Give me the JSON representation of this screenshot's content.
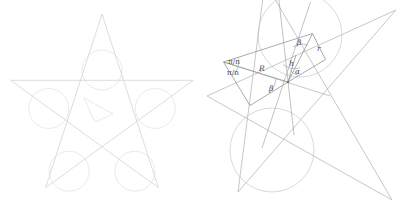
{
  "figure": {
    "canvas": {
      "width": 406,
      "height": 211,
      "background": "#ffffff"
    },
    "colors": {
      "star_left_stroke": "#d8d8d8",
      "circle_left_stroke": "#e2e2e2",
      "star_right_stroke": "#bdbdbd",
      "circle_right_stroke": "#cccccc",
      "annotation_stroke": "#8a8a8a",
      "label_color": "#4a4a4a"
    }
  },
  "left_panel": {
    "name": "pentagram-overview",
    "description": "Five pointed star polygon {5/2} with a circle inscribed in each of the five points",
    "star": {
      "points": 5,
      "center_x": 102,
      "center_y": 110,
      "outer_radius": 96,
      "rotation_deg": -90,
      "vertices": [
        {
          "x": 102.0,
          "y": 14.0
        },
        {
          "x": 193.3,
          "y": 80.3
        },
        {
          "x": 158.4,
          "y": 187.7
        },
        {
          "x": 45.6,
          "y": 187.7
        },
        {
          "x": 10.7,
          "y": 80.3
        }
      ]
    },
    "circles": [
      {
        "cx": 102.0,
        "cy": 70.0,
        "r": 20.0
      },
      {
        "cx": 155.3,
        "cy": 108.5,
        "r": 20.0
      },
      {
        "cx": 134.9,
        "cy": 171.2,
        "r": 20.0
      },
      {
        "cx": 69.1,
        "cy": 171.2,
        "r": 20.0
      },
      {
        "cx": 48.7,
        "cy": 108.5,
        "r": 20.0
      }
    ],
    "inner_marker": {
      "description": "small arrow-like inner detail near middle right of star",
      "path": "M 84 98 L 113 114 L 95 122 Z"
    }
  },
  "right_panel": {
    "name": "pentagram-detail",
    "description": "Rotated and magnified detail of one star point showing the construction angles and radii",
    "star": {
      "points": 5,
      "center_x": 300,
      "center_y": 66,
      "outer_radius": 150,
      "rotation_deg": -35
    },
    "annotations": {
      "apex": {
        "x": 288,
        "y": 82
      },
      "labels": [
        {
          "id": "pi-over-n-upper",
          "text": "π/n",
          "x": 232,
          "y": 61,
          "italic": false
        },
        {
          "id": "pi-over-n-lower",
          "text": "π/n",
          "x": 231,
          "y": 72,
          "italic": false
        },
        {
          "id": "big-r",
          "text": "R",
          "x": 262,
          "y": 68,
          "italic": true
        },
        {
          "id": "beta-lower",
          "text": "β",
          "x": 272,
          "y": 88,
          "italic": true
        },
        {
          "id": "beta-upper",
          "text": "β",
          "x": 300,
          "y": 42,
          "italic": true
        },
        {
          "id": "h-height",
          "text": "h",
          "x": 292,
          "y": 63,
          "italic": true
        },
        {
          "id": "alpha",
          "text": "α",
          "x": 298,
          "y": 71,
          "italic": true
        },
        {
          "id": "small-r",
          "text": "r",
          "x": 319,
          "y": 48,
          "italic": true
        }
      ],
      "symbol_meanings": {
        "π/n": "half of the central angle subtended at the star centre",
        "R": "circumradius from centre to star point vertex",
        "r": "inradius of the circle inscribed in the star point",
        "h": "height / apothem segment of the construction triangle",
        "α": "angle at the apex between h and R",
        "β": "base angle of the isoceles construction triangle"
      }
    }
  }
}
